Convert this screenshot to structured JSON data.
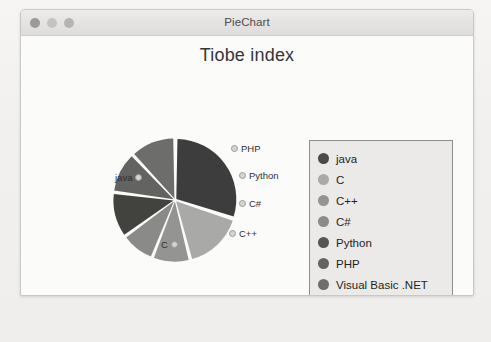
{
  "window": {
    "title": "PieChart",
    "controls": [
      {
        "name": "close",
        "color": "#9a9a99"
      },
      {
        "name": "minimize",
        "color": "#c3c3c1"
      },
      {
        "name": "zoom",
        "color": "#b4b4b2"
      }
    ]
  },
  "chart_title": "Tiobe index",
  "legend": {
    "items": [
      {
        "label": "java",
        "color": "#4a4a4a"
      },
      {
        "label": "C",
        "color": "#a9a9a7"
      },
      {
        "label": "C++",
        "color": "#949492"
      },
      {
        "label": "C#",
        "color": "#8a8a88"
      },
      {
        "label": "Python",
        "color": "#555553"
      },
      {
        "label": "PHP",
        "color": "#636361"
      },
      {
        "label": "Visual Basic .NET",
        "color": "#6d6d6b"
      }
    ]
  },
  "chart_data": {
    "type": "pie",
    "title": "Tiobe index",
    "labels": [
      "java",
      "C",
      "C++",
      "C#",
      "Python",
      "PHP",
      "Visual Basic .NET"
    ],
    "values": [
      30,
      16,
      10,
      9,
      12,
      11,
      12
    ],
    "colors": [
      "#3d3d3d",
      "#a9a9a7",
      "#949492",
      "#8a8a88",
      "#42423f",
      "#636361",
      "#6d6d6b"
    ],
    "legend_position": "right",
    "slice_labels": [
      {
        "text": "java",
        "x": 2,
        "y": 38
      },
      {
        "text": "PHP",
        "x": 118,
        "y": 9
      },
      {
        "text": "Python",
        "x": 126,
        "y": 36
      },
      {
        "text": "C#",
        "x": 126,
        "y": 64
      },
      {
        "text": "C++",
        "x": 116,
        "y": 94
      },
      {
        "text": "C",
        "x": 48,
        "y": 105
      }
    ]
  }
}
